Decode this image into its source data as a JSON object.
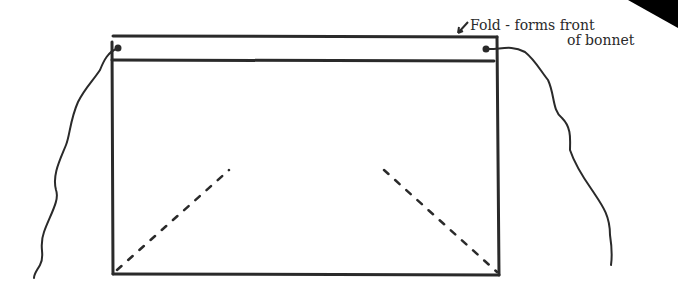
{
  "diagram": {
    "annotation": {
      "line1": "Fold - forms front",
      "line2": "of bonnet"
    },
    "colors": {
      "ink": "#2a2a2a",
      "background": "#ffffff",
      "corner_triangle": "#000000"
    }
  }
}
